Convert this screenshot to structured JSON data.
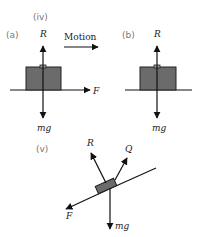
{
  "colors": {
    "ink": "#111111",
    "box_fill": "#6b6b6b",
    "box_stroke": "#222222",
    "tag_text": "#777777",
    "background": "#ffffff"
  },
  "labels": {
    "part_iv": "(iv)",
    "part_v": "(v)",
    "diagram_a": "(a)",
    "diagram_b": "(b)",
    "motion": "Motion"
  },
  "diagram_a": {
    "forces": {
      "reaction": "R",
      "friction": "F",
      "weight": "mg"
    }
  },
  "diagram_b": {
    "forces": {
      "reaction": "R",
      "weight": "mg"
    }
  },
  "diagram_v": {
    "forces": {
      "reaction": "R",
      "applied": "Q",
      "friction": "F",
      "weight": "mg"
    }
  }
}
